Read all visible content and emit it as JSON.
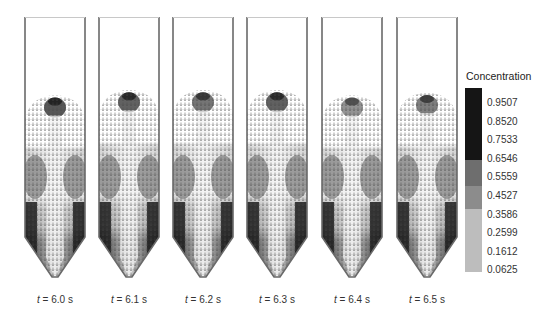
{
  "figure": {
    "panels": [
      {
        "label_prefix": "t",
        "label_value": " = 6.0 s",
        "time": "6.0 s",
        "plume_top": 0.3,
        "plume_dark": 0.85
      },
      {
        "label_prefix": "t",
        "label_value": " = 6.1 s",
        "time": "6.1 s",
        "plume_top": 0.28,
        "plume_dark": 0.8
      },
      {
        "label_prefix": "t",
        "label_value": " = 6.2 s",
        "time": "6.2 s",
        "plume_top": 0.28,
        "plume_dark": 0.7
      },
      {
        "label_prefix": "t",
        "label_value": " = 6.3 s",
        "time": "6.3 s",
        "plume_top": 0.28,
        "plume_dark": 0.8
      },
      {
        "label_prefix": "t",
        "label_value": " = 6.4 s",
        "time": "6.4 s",
        "plume_top": 0.3,
        "plume_dark": 0.55
      },
      {
        "label_prefix": "t",
        "label_value": " = 6.5 s",
        "time": "6.5 s",
        "plume_top": 0.29,
        "plume_dark": 0.65
      }
    ]
  },
  "legend": {
    "title": "Concentration",
    "ticks": [
      "0.9507",
      "0.8520",
      "0.7533",
      "0.6546",
      "0.5559",
      "0.4527",
      "0.3586",
      "0.2599",
      "0.1612",
      "0.0625"
    ],
    "bands": [
      {
        "from": 0.0,
        "to": 0.39,
        "color": "#151515"
      },
      {
        "from": 0.39,
        "to": 0.53,
        "color": "#6e6e6e"
      },
      {
        "from": 0.53,
        "to": 0.66,
        "color": "#8c8c8c"
      },
      {
        "from": 0.66,
        "to": 1.0,
        "color": "#bdbdbd"
      }
    ]
  },
  "colors": {
    "wall": "#6a6a6a",
    "dark": "#1c1c1c",
    "mid": "#7a7a7a",
    "light": "#d8d8d8",
    "background": "#ffffff"
  }
}
